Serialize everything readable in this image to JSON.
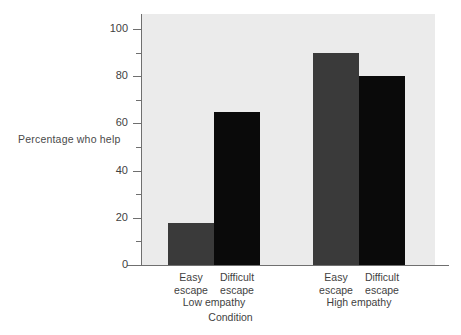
{
  "chart_data": {
    "type": "bar",
    "title": "",
    "subtitle": "",
    "xlabel": "Condition",
    "ylabel": "Percentage who help",
    "ylim": [
      0,
      100
    ],
    "ytick_step": 20,
    "yminor_step": 10,
    "grid": false,
    "legend": "none",
    "categories": [
      "Easy escape",
      "Difficult escape",
      "Easy escape",
      "Difficult escape"
    ],
    "values": [
      18,
      65,
      90,
      80
    ],
    "groups": [
      {
        "name": "Low empathy",
        "bars": [
          {
            "label_line1": "Easy",
            "label_line2": "escape",
            "value": 18,
            "color": "#3a3a3a"
          },
          {
            "label_line1": "Difficult",
            "label_line2": "escape",
            "value": 65,
            "color": "#0a0a0a"
          }
        ]
      },
      {
        "name": "High empathy",
        "bars": [
          {
            "label_line1": "Easy",
            "label_line2": "escape",
            "value": 90,
            "color": "#3a3a3a"
          },
          {
            "label_line1": "Difficult",
            "label_line2": "escape",
            "value": 80,
            "color": "#0a0a0a"
          }
        ]
      }
    ],
    "yticks": [
      {
        "value": 100,
        "label": "100"
      },
      {
        "value": 90,
        "label": ""
      },
      {
        "value": 80,
        "label": "80"
      },
      {
        "value": 70,
        "label": ""
      },
      {
        "value": 60,
        "label": "60"
      },
      {
        "value": 50,
        "label": ""
      },
      {
        "value": 40,
        "label": "40"
      },
      {
        "value": 30,
        "label": ""
      },
      {
        "value": 20,
        "label": "20"
      },
      {
        "value": 10,
        "label": ""
      },
      {
        "value": 0,
        "label": "0"
      }
    ],
    "colors": {
      "plot_background": "#ebebeb",
      "page_background": "#ffffff",
      "axis": "#6f6f6f",
      "text": "#3f3f3f",
      "bar_easy_escape": "#3a3a3a",
      "bar_difficult_escape": "#0a0a0a"
    }
  }
}
